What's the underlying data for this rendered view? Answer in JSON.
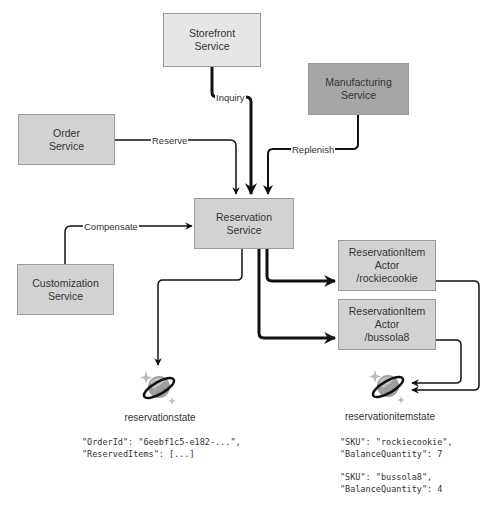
{
  "nodes": {
    "storefront": {
      "line1": "Storefront",
      "line2": "Service",
      "fill": "#e6e6e6"
    },
    "manufacturing": {
      "line1": "Manufacturing",
      "line2": "Service",
      "fill": "#a6a6a6"
    },
    "order": {
      "line1": "Order",
      "line2": "Service",
      "fill": "#d2d2d2"
    },
    "reservation": {
      "line1": "Reservation",
      "line2": "Service",
      "fill": "#d2d2d2"
    },
    "customization": {
      "line1": "Customization",
      "line2": "Service",
      "fill": "#d2d2d2"
    },
    "actor_rockiecookie": {
      "line1": "ReservationItem",
      "line2": "Actor",
      "line3": "/rockiecookie",
      "fill": "#d2d2d2"
    },
    "actor_bussola8": {
      "line1": "ReservationItem",
      "line2": "Actor",
      "line3": "/bussola8",
      "fill": "#d2d2d2"
    }
  },
  "edges": {
    "inquiry": "Inquiry",
    "reserve": "Reserve",
    "replenish": "Replenish",
    "compensate": "Compensate"
  },
  "stores": {
    "reservationstate": {
      "label": "reservationstate",
      "json": "\"OrderId\": \"6eebf1c5-e182-...\",\n\"ReservedItems\": [...]"
    },
    "reservationitemstate": {
      "label": "reservationitemstate",
      "json1": "\"SKU\": \"rockiecookie\",\n\"BalanceQuantity\": 7",
      "json2": "\"SKU\": \"bussola8\",\n\"BalanceQuantity\": 4"
    }
  }
}
